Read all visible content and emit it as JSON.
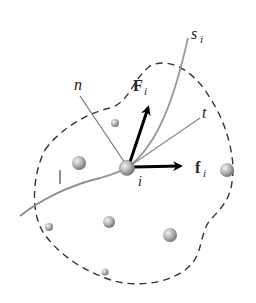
{
  "diagram": {
    "title": "",
    "labels": {
      "path": "s",
      "path_sub": "i",
      "normal": "n",
      "tangent": "t",
      "external_force": "F",
      "external_force_sub": "i",
      "internal_force": "f",
      "internal_force_sub": "i",
      "particle": "i"
    },
    "colors": {
      "boundary": "#333333",
      "path": "#888888",
      "axes": "#777777",
      "arrows": "#000000",
      "particle": "#a8a8a8"
    },
    "other_particles": [
      {
        "x": 115,
        "y": 123,
        "r": 4
      },
      {
        "x": 79,
        "y": 163,
        "r": 7
      },
      {
        "x": 227,
        "y": 170,
        "r": 7
      },
      {
        "x": 109,
        "y": 222,
        "r": 6
      },
      {
        "x": 170,
        "y": 235,
        "r": 7
      },
      {
        "x": 49,
        "y": 227,
        "r": 4
      },
      {
        "x": 105,
        "y": 272,
        "r": 3.5
      }
    ]
  }
}
